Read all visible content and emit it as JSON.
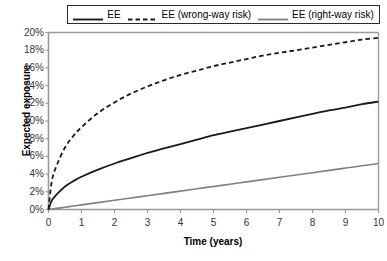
{
  "chart_data": {
    "type": "line",
    "title": "",
    "xlabel": "Time (years)",
    "ylabel": "Expected exposure",
    "xlim": [
      0,
      10
    ],
    "ylim": [
      0,
      0.2
    ],
    "grid": false,
    "legend_position": "top",
    "xticks": [
      "0",
      "1",
      "2",
      "3",
      "4",
      "5",
      "6",
      "7",
      "8",
      "9",
      "10"
    ],
    "yticks": [
      "0%",
      "2%",
      "4%",
      "6%",
      "8%",
      "10%",
      "12%",
      "14%",
      "16%",
      "18%",
      "20%"
    ],
    "x": [
      0,
      0.1,
      0.25,
      0.5,
      0.75,
      1,
      1.5,
      2,
      2.5,
      3,
      3.5,
      4,
      4.5,
      5,
      5.5,
      6,
      6.5,
      7,
      7.5,
      8,
      8.5,
      9,
      9.5,
      10
    ],
    "series": [
      {
        "name": "EE",
        "style": "solid",
        "color": "#1a1a1a",
        "width": 1.8,
        "values": [
          0,
          1.0,
          1.7,
          2.6,
          3.2,
          3.7,
          4.5,
          5.2,
          5.8,
          6.4,
          6.9,
          7.4,
          7.9,
          8.4,
          8.8,
          9.2,
          9.6,
          10.0,
          10.4,
          10.8,
          11.2,
          11.5,
          11.9,
          12.2
        ]
      },
      {
        "name": "EE (wrong-way risk)",
        "style": "dashed",
        "color": "#1a1a1a",
        "width": 1.8,
        "values": [
          0,
          3.2,
          5.0,
          7.0,
          8.3,
          9.3,
          10.9,
          12.1,
          13.1,
          13.9,
          14.6,
          15.2,
          15.7,
          16.2,
          16.6,
          17.0,
          17.4,
          17.7,
          18.0,
          18.3,
          18.6,
          18.9,
          19.2,
          19.4
        ]
      },
      {
        "name": "EE (right-way risk)",
        "style": "solid",
        "color": "#808080",
        "width": 1.6,
        "values": [
          0,
          0.05,
          0.13,
          0.26,
          0.39,
          0.52,
          0.78,
          1.04,
          1.3,
          1.56,
          1.82,
          2.08,
          2.34,
          2.6,
          2.86,
          3.12,
          3.38,
          3.64,
          3.9,
          4.16,
          4.42,
          4.68,
          4.94,
          5.2
        ]
      }
    ]
  },
  "legend": {
    "entries": [
      {
        "label": "EE"
      },
      {
        "label": "EE (wrong-way risk)"
      },
      {
        "label": "EE (right-way risk)"
      }
    ]
  },
  "axes": {
    "x_title": "Time (years)",
    "y_title": "Expected exposure"
  },
  "caption": {
    "fragment": ""
  }
}
